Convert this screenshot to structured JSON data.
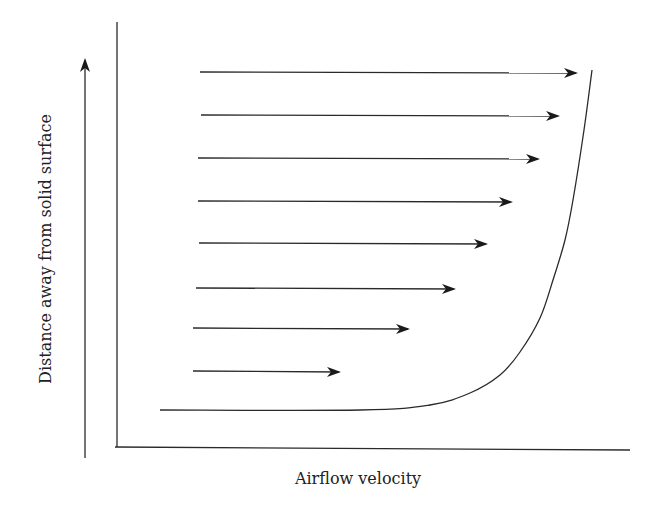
{
  "figure": {
    "xlabel": "Airflow velocity",
    "ylabel": "Distance away from solid surface",
    "colors": {
      "ink": "#2a2a2a",
      "background": "#ffffff"
    }
  },
  "axes": {
    "y_direction_arrow": {
      "x": 85,
      "y_start": 458,
      "y_end": 60
    },
    "frame_vertical": {
      "x": 117,
      "y_top": 22,
      "y_bottom": 447
    },
    "frame_horizontal": {
      "y": 447,
      "x_left": 115,
      "x_right": 630
    }
  },
  "velocity_arrows": [
    {
      "index": 1,
      "y": 72,
      "x_start": 200,
      "x_end": 576
    },
    {
      "index": 2,
      "y": 115,
      "x_start": 201,
      "x_end": 558
    },
    {
      "index": 3,
      "y": 158,
      "x_start": 198,
      "x_end": 538
    },
    {
      "index": 4,
      "y": 201,
      "x_start": 198,
      "x_end": 511
    },
    {
      "index": 5,
      "y": 243,
      "x_start": 199,
      "x_end": 486
    },
    {
      "index": 6,
      "y": 288,
      "x_start": 196,
      "x_end": 454
    },
    {
      "index": 7,
      "y": 328,
      "x_start": 193,
      "x_end": 408
    },
    {
      "index": 8,
      "y": 371,
      "x_start": 193,
      "x_end": 339
    }
  ],
  "profile_curve": {
    "description": "Velocity profile envelope rising from near-zero at the surface",
    "points": [
      [
        160,
        410
      ],
      [
        360,
        410
      ],
      [
        430,
        405
      ],
      [
        470,
        393
      ],
      [
        500,
        375
      ],
      [
        520,
        352
      ],
      [
        540,
        318
      ],
      [
        553,
        280
      ],
      [
        565,
        240
      ],
      [
        573,
        200
      ],
      [
        584,
        130
      ],
      [
        592,
        70
      ]
    ]
  }
}
